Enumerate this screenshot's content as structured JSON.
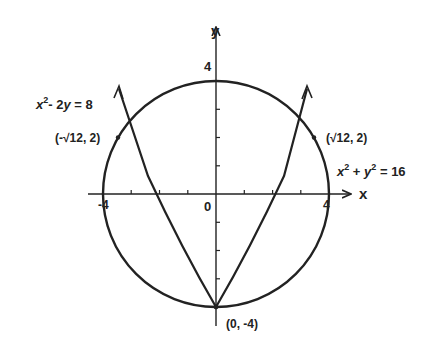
{
  "diagram": {
    "axes": {
      "x_label": "x",
      "y_label": "y",
      "origin_label": "0",
      "x_tick_labels": {
        "neg": "-4",
        "pos": "4"
      },
      "y_tick_label_top": "4"
    },
    "circle": {
      "equation": "x² + y² = 16",
      "eq_parts": [
        "x",
        "2",
        " + ",
        "y",
        "2",
        " = 16"
      ],
      "radius": 4
    },
    "parabola": {
      "equation": "x² - 2y = 8",
      "eq_parts": [
        "x",
        "2",
        "- 2",
        "y",
        " = 8"
      ]
    },
    "points": [
      {
        "label": "(-√12, 2)",
        "x": -3.464,
        "y": 2
      },
      {
        "label": "(√12, 2)",
        "x": 3.464,
        "y": 2
      },
      {
        "label": "(0, -4)",
        "x": 0,
        "y": -4
      }
    ],
    "colors": {
      "stroke": "#222222",
      "background": "#ffffff"
    }
  }
}
